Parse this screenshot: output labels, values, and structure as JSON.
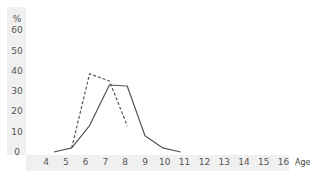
{
  "chart_data": {
    "type": "line",
    "title": "",
    "xlabel": "Age",
    "ylabel": "%",
    "x_ticks": [
      "4",
      "5",
      "6",
      "7",
      "8",
      "9",
      "10",
      "11",
      "12",
      "13",
      "14",
      "15",
      "16"
    ],
    "y_ticks": [
      "0",
      "10",
      "20",
      "30",
      "40",
      "50",
      "60"
    ],
    "xlim": [
      4,
      16
    ],
    "ylim": [
      0,
      60
    ],
    "grid": false,
    "legend": null,
    "series": [
      {
        "name": "solid",
        "style": "solid",
        "color": "#555555",
        "points": [
          [
            4.4,
            0
          ],
          [
            5.3,
            2
          ],
          [
            6.2,
            13
          ],
          [
            7.2,
            33
          ],
          [
            8.1,
            32.5
          ],
          [
            9.0,
            8
          ],
          [
            9.9,
            2
          ],
          [
            10.8,
            0
          ]
        ]
      },
      {
        "name": "dashed",
        "style": "dashed",
        "color": "#555555",
        "points": [
          [
            5.3,
            2
          ],
          [
            6.2,
            38.5
          ],
          [
            7.2,
            35
          ],
          [
            8.1,
            13
          ]
        ]
      }
    ]
  },
  "axis": {
    "unit_label": "%",
    "x_title": "Age"
  }
}
